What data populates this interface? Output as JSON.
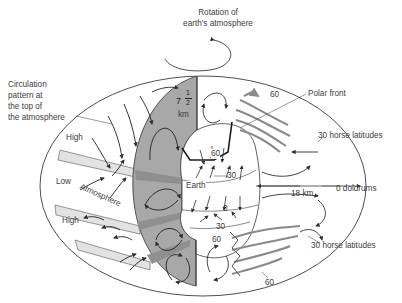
{
  "diagram": {
    "title_line1": "Rotation of",
    "title_line2": "earth's atmosphere",
    "circulation_label": [
      "Circulation",
      "pattern at",
      "the top of",
      "the atmosphere"
    ],
    "left_labels": {
      "high_top": "High",
      "low": "Low",
      "high_bottom": "High"
    },
    "band_label": "Atmosphere",
    "earth_label": "Earth",
    "height_label": {
      "whole": "7",
      "num": "1",
      "den": "2",
      "unit": "km"
    },
    "equator_height": "18 km",
    "right_labels": {
      "polar_front": "Polar front",
      "sixty_top": "60",
      "horse_top": "30 horse latitudes",
      "doldrums": "0 doldrums",
      "horse_bottom": "30 horse latitudes",
      "sixty_bottom": "60"
    },
    "latitude_marks": {
      "sixty_n": "60",
      "thirty_n": "30",
      "zero": "0",
      "thirty_s": "30",
      "sixty_s": "60"
    },
    "colors": {
      "line": "#3a3a3a",
      "shade": "#a8a8a8",
      "shade_dark": "#8f8f8f",
      "band": "#e2e2e2",
      "hatch": "#8a8a8a"
    }
  }
}
